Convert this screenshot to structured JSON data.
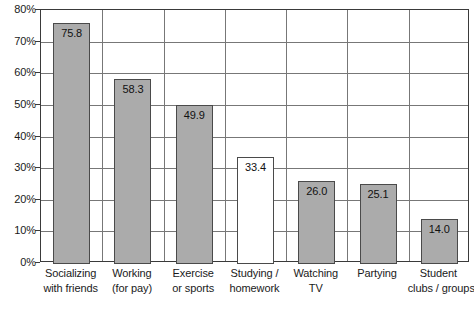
{
  "chart_data": {
    "type": "bar",
    "title": "",
    "subtitle": "",
    "xlabel": "",
    "ylabel": "",
    "ylim": [
      0,
      80
    ],
    "ytick_labels": [
      "0%",
      "10%",
      "20%",
      "30%",
      "40%",
      "50%",
      "60%",
      "70%",
      "80%"
    ],
    "ytick_values": [
      0,
      10,
      20,
      30,
      40,
      50,
      60,
      70,
      80
    ],
    "grid": true,
    "legend": false,
    "categories": [
      "Socializing with friends",
      "Working (for pay)",
      "Exercise or sports",
      "Studying / homework",
      "Watching TV",
      "Partying",
      "Student clubs / groups"
    ],
    "category_lines": [
      [
        "Socializing",
        "with friends"
      ],
      [
        "Working",
        "(for pay)"
      ],
      [
        "Exercise",
        "or sports"
      ],
      [
        "Studying /",
        "homework"
      ],
      [
        "Watching",
        "TV"
      ],
      [
        "Partying"
      ],
      [
        "Student",
        "clubs / groups"
      ]
    ],
    "values": [
      75.8,
      58.3,
      49.9,
      33.4,
      26.0,
      25.1,
      14.0
    ],
    "value_labels": [
      "75.8",
      "58.3",
      "49.9",
      "33.4",
      "26.0",
      "25.1",
      "14.0"
    ],
    "bar_fills": [
      "filled",
      "filled",
      "filled",
      "unfilled",
      "filled",
      "filled",
      "filled"
    ],
    "colors": {
      "bar_fill": "#ababab",
      "bar_unfilled_fill": "#ffffff",
      "bar_border": "#4a4a4a",
      "gridline": "#777777",
      "axis_frame": "#3a3a3a",
      "text": "#1a1a1a",
      "background": "#ffffff"
    }
  }
}
